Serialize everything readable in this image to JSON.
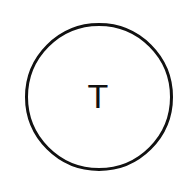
{
  "diagram": {
    "nodes": [
      {
        "label": "T",
        "shape": "circle",
        "stroke_color": "#111111",
        "fill_color": "#ffffff"
      }
    ]
  }
}
